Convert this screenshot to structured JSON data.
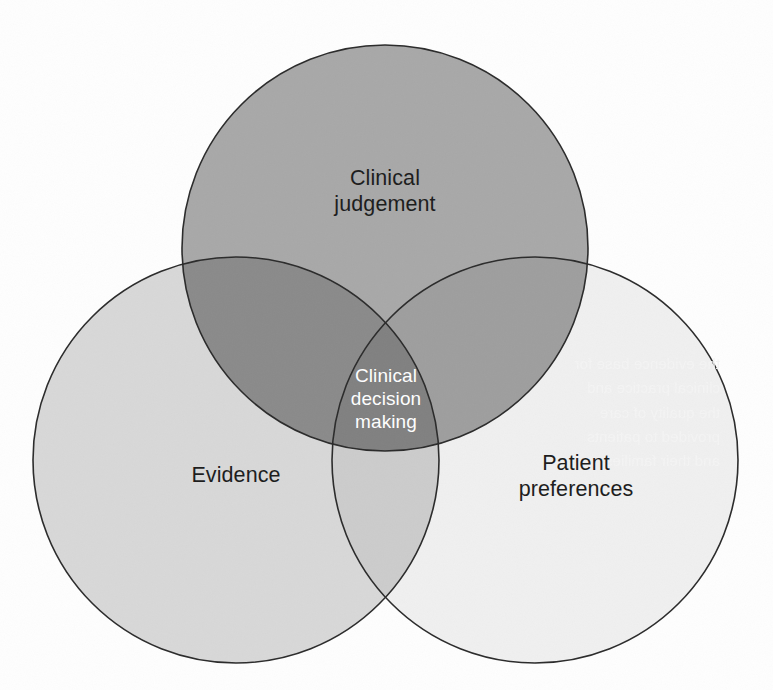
{
  "diagram": {
    "type": "venn-3-circle",
    "canvas": {
      "width": 773,
      "height": 690,
      "background": "#fefefe"
    },
    "circles": [
      {
        "id": "clinical-judgement",
        "label": "Clinical\njudgement",
        "position": "top",
        "cx": 385,
        "cy": 248,
        "r": 203,
        "fill": "#a8a8a8",
        "stroke": "#2a2a2a",
        "label_color": "#1b1b1b"
      },
      {
        "id": "evidence",
        "label": "Evidence",
        "position": "bottom-left",
        "cx": 236,
        "cy": 460,
        "r": 203,
        "fill": "#d8d8d8",
        "stroke": "#2a2a2a",
        "label_color": "#1b1b1b"
      },
      {
        "id": "patient-preferences",
        "label": "Patient\npreferences",
        "position": "bottom-right",
        "cx": 535,
        "cy": 460,
        "r": 203,
        "fill": "#f0f0f0",
        "stroke": "#2a2a2a",
        "label_color": "#1b1b1b"
      }
    ],
    "intersections": [
      {
        "id": "judgement-evidence",
        "sets": [
          "clinical-judgement",
          "evidence"
        ],
        "fill": "#8a8a8a"
      },
      {
        "id": "judgement-patient",
        "sets": [
          "clinical-judgement",
          "patient-preferences"
        ],
        "fill": "#9e9e9e"
      },
      {
        "id": "evidence-patient",
        "sets": [
          "evidence",
          "patient-preferences"
        ],
        "fill": "#cccccc"
      },
      {
        "id": "center-all-three",
        "sets": [
          "clinical-judgement",
          "evidence",
          "patient-preferences"
        ],
        "fill": "#808080",
        "label": "Clinical\ndecision\nmaking",
        "label_color": "#ffffff"
      }
    ],
    "stroke_width": 1.6,
    "bleed_through_text": "the evidence base for\nclinical practice and\nthe quality of care\nprovided to patients\nand their families"
  }
}
